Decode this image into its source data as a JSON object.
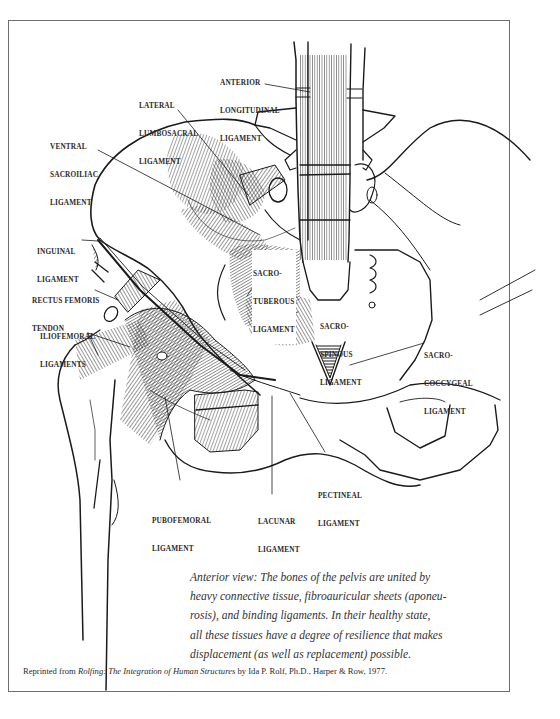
{
  "figure": {
    "view": "Anterior view of the pelvis and hip joint ligaments",
    "labels": {
      "anterior_longitudinal": [
        "ANTERIOR",
        "LONGITUDINAL",
        "LIGAMENT"
      ],
      "lateral_lumbosacral": [
        "LATERAL",
        "LUMBOSACRAL",
        "LIGAMENT"
      ],
      "ventral_sacroiliac": [
        "VENTRAL",
        "SACROILIAC",
        "LIGAMENT"
      ],
      "inguinal": [
        "INGUINAL",
        "LIGAMENT"
      ],
      "rectus_femoris": [
        "RECTUS FEMORIS",
        "TENDON"
      ],
      "iliofemoral": [
        "ILIOFEMORAL",
        "LIGAMENTS"
      ],
      "sacrotuberous": [
        "SACRO-",
        "TUBEROUS",
        "LIGAMENT"
      ],
      "sacrospinous": [
        "SACRO-",
        "SPINOUS",
        "LIGAMENT"
      ],
      "sacrococcygeal": [
        "SACRO-",
        "COCCYGEAL",
        "LIGAMENT"
      ],
      "pectineal": [
        "PECTINEAL",
        "LIGAMENT"
      ],
      "pubofemoral": [
        "PUBOFEMORAL",
        "LIGAMENT"
      ],
      "lacunar": [
        "LACUNAR",
        "LIGAMENT"
      ]
    }
  },
  "caption": {
    "lines": [
      "Anterior view: The bones of the pelvis are united by",
      "heavy connective tissue, fibroauricular sheets (aponeu-",
      "rosis), and binding ligaments. In their healthy state,",
      "all these tissues have a degree of resilience that makes",
      "displacement (as well as replacement) possible."
    ]
  },
  "credit": {
    "prefix": "Reprinted from ",
    "book_title": "Rolfing: The Integration of Human Structures",
    "suffix": " by Ida P. Rolf, Ph.D., Harper & Row, 1977."
  },
  "colors": {
    "ink": "#1a1a1a",
    "frame": "#6e6e6e",
    "background": "#ffffff"
  }
}
